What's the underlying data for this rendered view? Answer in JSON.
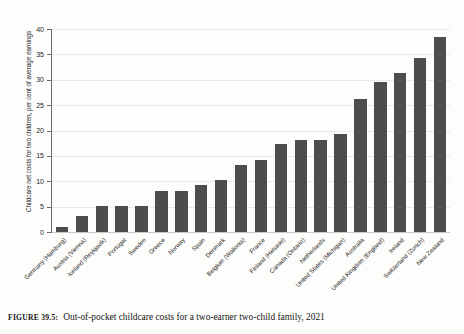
{
  "caption": {
    "tag": "Figure 39.5:",
    "text": "Out-of-pocket childcare costs for a two-earner two-child family, 2021"
  },
  "colors": {
    "bar": "#4d4d4d",
    "grid": "#e8e8e6",
    "axis": "#6b6b68",
    "text": "#1d1d1c",
    "background": "#fdfdfc"
  },
  "chart_data": {
    "type": "bar",
    "title": "",
    "subtitle": "",
    "xlabel": "",
    "ylabel": "Childcare net costs for two children, per cent of average earnings",
    "ylim": [
      0,
      40
    ],
    "yticks": [
      0,
      5,
      10,
      15,
      20,
      25,
      30,
      35,
      40
    ],
    "ytick_labels": [
      "0",
      "5",
      "10",
      "15",
      "20",
      "25",
      "30",
      "35",
      "40"
    ],
    "grid": true,
    "legend": false,
    "legend_position": "none",
    "categories": [
      "Germany (Hamburg)",
      "Austria (Vienna)",
      "Iceland (Reykjavik)",
      "Portugal",
      "Sweden",
      "Greece",
      "Norway",
      "Spain",
      "Denmark",
      "Belgium (Wallonia)",
      "France",
      "Finland (Helsinki)",
      "Canada (Ontario)",
      "Netherlands",
      "United States (Michigan)",
      "Australia",
      "United Kingdom (England)",
      "Ireland",
      "Switzerland (Zurich)",
      "New Zealand"
    ],
    "values": [
      1.0,
      3.1,
      5.1,
      5.1,
      5.1,
      8.1,
      8.1,
      9.2,
      10.2,
      13.2,
      14.2,
      17.3,
      18.2,
      18.2,
      19.3,
      26.3,
      29.5,
      31.4,
      34.3,
      38.4
    ]
  }
}
